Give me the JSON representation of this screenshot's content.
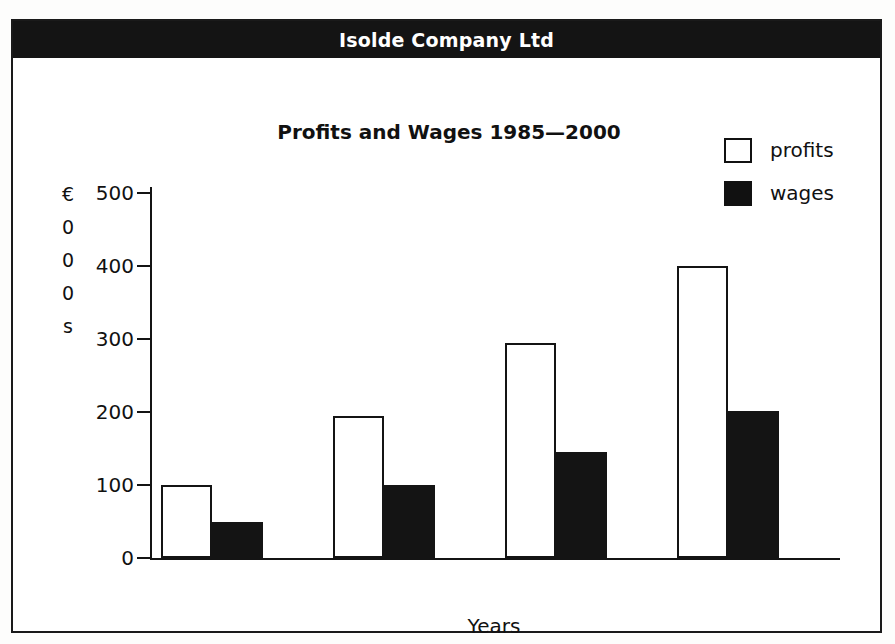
{
  "document": {
    "banner_title": "Isolde Company Ltd"
  },
  "legend": {
    "position": "top-right",
    "entries": [
      {
        "label": "profits",
        "swatch": "hollow-square-icon",
        "color": "#ffffff"
      },
      {
        "label": "wages",
        "swatch": "filled-square-icon",
        "color": "#141414"
      }
    ]
  },
  "chart_data": {
    "type": "bar",
    "title": "Profits and Wages 1985—2000",
    "xlabel": "Years",
    "ylabel": "€000s",
    "ylabel_stacked": [
      "€",
      "0",
      "0",
      "0",
      "s"
    ],
    "categories": [
      "1985",
      "1990",
      "1995",
      "2000"
    ],
    "series": [
      {
        "name": "profits",
        "values": [
          100,
          195,
          295,
          400
        ]
      },
      {
        "name": "wages",
        "values": [
          50,
          100,
          145,
          202
        ]
      }
    ],
    "ylim": [
      0,
      500
    ],
    "yticks": [
      0,
      100,
      200,
      300,
      400,
      500
    ],
    "ytick_labels": [
      "0",
      "100",
      "200",
      "300",
      "400",
      "500"
    ],
    "grid": false,
    "legend_position": "top-right"
  },
  "colors": {
    "banner_background": "#141414",
    "banner_text": "#ffffff",
    "ink": "#141414",
    "paper": "#ffffff"
  }
}
